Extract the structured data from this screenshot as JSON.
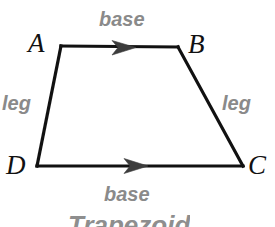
{
  "figure": {
    "shape_name": "trapezoid",
    "caption": "Trapezoid",
    "stroke_color": "#111111",
    "label_color": "#8a8a8a",
    "vertex_color": "#111111",
    "background": "#ffffff",
    "vertices": [
      {
        "name": "A",
        "label": "A",
        "x": 61,
        "y": 46
      },
      {
        "name": "B",
        "label": "B",
        "x": 178,
        "y": 47
      },
      {
        "name": "C",
        "label": "C",
        "x": 243,
        "y": 166
      },
      {
        "name": "D",
        "label": "D",
        "x": 37,
        "y": 166
      }
    ],
    "edges": [
      {
        "name": "top-base",
        "from": "A",
        "to": "B",
        "part_label": "base",
        "arrow": true,
        "arrow_direction": "right"
      },
      {
        "name": "right-leg",
        "from": "B",
        "to": "C",
        "part_label": "leg",
        "arrow": false
      },
      {
        "name": "bottom-base",
        "from": "D",
        "to": "C",
        "part_label": "base",
        "arrow": true,
        "arrow_direction": "right"
      },
      {
        "name": "left-leg",
        "from": "A",
        "to": "D",
        "part_label": "leg",
        "arrow": false
      }
    ],
    "labels": {
      "base_top": "base",
      "base_bottom": "base",
      "leg_left": "leg",
      "leg_right": "leg",
      "vertex_a": "A",
      "vertex_b": "B",
      "vertex_c": "C",
      "vertex_d": "D"
    }
  }
}
